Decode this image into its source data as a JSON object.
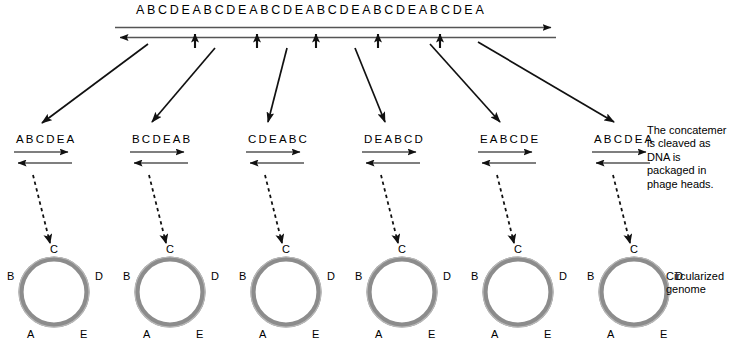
{
  "figure": {
    "concatemer": {
      "sequence": "ABCDEABCDEABCDEABCDEABCDEABCDEA",
      "right_arrow_name": "concatemer-right-arrow",
      "left_arrow_name": "concatemer-left-arrow"
    },
    "cleavage_note": "The concatemer\nis cleaved as\nDNA is\npackaged in\nphage heads.",
    "circularized_note": "Circularized\ngenome",
    "fragments": [
      {
        "sequence": "ABCDEA"
      },
      {
        "sequence": "BCDEAB"
      },
      {
        "sequence": "CDEABC"
      },
      {
        "sequence": "DEABCD"
      },
      {
        "sequence": "EABCDE"
      },
      {
        "sequence": "ABCDEA"
      }
    ],
    "genomes": [
      {
        "top": "C",
        "upper_left": "B",
        "upper_right": "D",
        "lower_left": "A",
        "lower_right": "E"
      },
      {
        "top": "C",
        "upper_left": "B",
        "upper_right": "D",
        "lower_left": "A",
        "lower_right": "E"
      },
      {
        "top": "C",
        "upper_left": "B",
        "upper_right": "D",
        "lower_left": "A",
        "lower_right": "E"
      },
      {
        "top": "C",
        "upper_left": "B",
        "upper_right": "D",
        "lower_left": "A",
        "lower_right": "E"
      },
      {
        "top": "C",
        "upper_left": "B",
        "upper_right": "D",
        "lower_left": "A",
        "lower_right": "E"
      },
      {
        "top": "C",
        "upper_left": "B",
        "upper_right": "D",
        "lower_left": "A",
        "lower_right": "E"
      }
    ],
    "colors": {
      "ring": "#8c8c8c",
      "ring_highlight": "#b5b5b5",
      "line": "#555555",
      "arrow": "#000000",
      "background": "#ffffff"
    }
  }
}
